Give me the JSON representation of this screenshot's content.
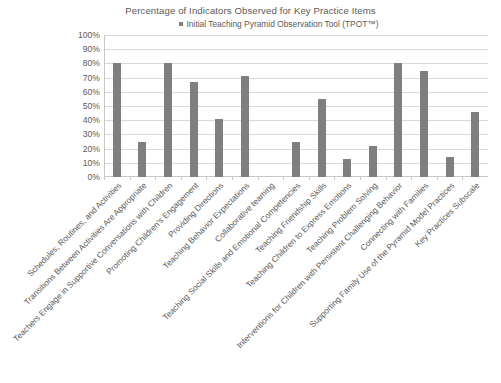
{
  "chart_data": {
    "type": "bar",
    "title": "Percentage of Indicators Observed for Key Practice Items",
    "xlabel": "",
    "ylabel": "",
    "ylim": [
      0,
      100
    ],
    "ytick_labels": [
      "100%",
      "90%",
      "80%",
      "70%",
      "60%",
      "50%",
      "40%",
      "30%",
      "20%",
      "10%",
      "0%"
    ],
    "ytick_values": [
      100,
      90,
      80,
      70,
      60,
      50,
      40,
      30,
      20,
      10,
      0
    ],
    "grid": true,
    "legend_position": "top-center",
    "series": [
      {
        "name": "Initial  Teaching Pyramid Observation Tool (TPOT™)",
        "color": "#7f7f7f",
        "values": [
          80,
          25,
          80,
          67,
          41,
          71,
          0,
          25,
          55,
          13,
          22,
          80,
          75,
          14,
          46
        ]
      }
    ],
    "categories": [
      "Schedules, Routines, and Activities",
      "Transitions Between Activities Are Appropriate",
      "Teachers Engage in Supportive Conversations with Children",
      "Promoting Children's Engagement",
      "Providing Directions",
      "Teaching Behavior Expectations",
      "Collaborative teaming",
      "Teaching Social Skills and Emotional Competencies",
      "Teaching Friendship Skills",
      "Teaching Children to Express Emotions",
      "Teaching Problem Solving",
      "Interventions for Children with Persistent Challenging Behavior",
      "Connecting with Families",
      "Supporting Family Use of the Pyramid Model Practices",
      "Key Practices Subscale"
    ]
  },
  "legend": {
    "marker": "square-marker",
    "label": "Initial  Teaching Pyramid Observation Tool (TPOT™)"
  },
  "colors": {
    "bar": "#7f7f7f",
    "gridline": "#d9d9d9",
    "axis": "#c8c8c8",
    "text": "#5a5a5a",
    "background": "#ffffff"
  }
}
